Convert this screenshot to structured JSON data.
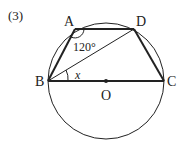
{
  "problem_number": "(3)",
  "points": {
    "A": {
      "label": "A",
      "x": 75,
      "y": 29
    },
    "B": {
      "label": "B",
      "x": 48,
      "y": 81
    },
    "C": {
      "label": "C",
      "x": 164,
      "y": 81
    },
    "D": {
      "label": "D",
      "x": 134,
      "y": 29
    },
    "O": {
      "label": "O",
      "x": 106,
      "y": 81
    }
  },
  "circle": {
    "cx": 106,
    "cy": 81,
    "r": 58
  },
  "angle_labels": {
    "angle_A": "120°",
    "angle_x": "x"
  },
  "colors": {
    "stroke": "#222222",
    "background": "#ffffff"
  }
}
